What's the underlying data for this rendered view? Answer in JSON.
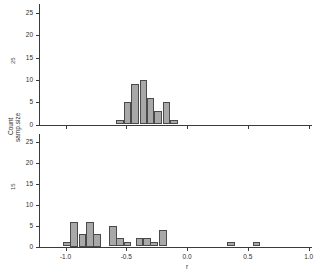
{
  "chart_data": {
    "type": "bar",
    "title": "",
    "xlabel": "r",
    "ylabel": "Count",
    "ylabel2": "samp.size",
    "orientation": "two-panel stacked histogram",
    "xlim": [
      -1.28,
      1.28
    ],
    "ylim": [
      0,
      27
    ],
    "xticks": [
      -1.0,
      -0.5,
      0.0,
      0.5,
      1.0
    ],
    "xticklabels": [
      "-1.0",
      "-0.5",
      "0.0",
      "0.5",
      "1.0"
    ],
    "yticks": [
      0,
      5,
      10,
      15,
      20,
      25
    ],
    "yticklabels": [
      "0",
      "5",
      "10",
      "15",
      "20",
      "25"
    ],
    "grid": false,
    "bin_width": 0.0625,
    "panels": [
      {
        "name": "top-panel",
        "tag": "25",
        "bars": [
          {
            "x": -0.55,
            "value": 1
          },
          {
            "x": -0.49,
            "value": 5
          },
          {
            "x": -0.43,
            "value": 9
          },
          {
            "x": -0.36,
            "value": 10
          },
          {
            "x": -0.3,
            "value": 6
          },
          {
            "x": -0.24,
            "value": 3
          },
          {
            "x": -0.17,
            "value": 5
          },
          {
            "x": -0.11,
            "value": 1
          }
        ]
      },
      {
        "name": "bottom-panel",
        "tag": "15",
        "bars": [
          {
            "x": -0.99,
            "value": 1
          },
          {
            "x": -0.93,
            "value": 6
          },
          {
            "x": -0.86,
            "value": 3
          },
          {
            "x": -0.8,
            "value": 6
          },
          {
            "x": -0.74,
            "value": 3
          },
          {
            "x": -0.61,
            "value": 5
          },
          {
            "x": -0.55,
            "value": 2
          },
          {
            "x": -0.49,
            "value": 1
          },
          {
            "x": -0.39,
            "value": 2
          },
          {
            "x": -0.33,
            "value": 2
          },
          {
            "x": -0.27,
            "value": 1
          },
          {
            "x": -0.2,
            "value": 4
          },
          {
            "x": 0.36,
            "value": 1
          },
          {
            "x": 0.57,
            "value": 1
          }
        ]
      }
    ]
  }
}
